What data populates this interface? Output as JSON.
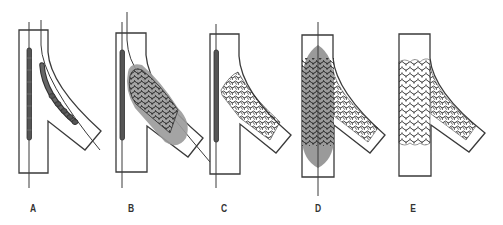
{
  "figure": {
    "colors": {
      "outline": "#3a3a3a",
      "balloon": "#9a9a9a",
      "stent_dark": "#2e2e2e",
      "background": "#ffffff"
    },
    "panels": [
      {
        "label": "A",
        "step": "Two guidewires with undeployed stent/balloon systems positioned in main vessel and side branch"
      },
      {
        "label": "B",
        "step": "Side branch stent deployed with inflated balloon, main vessel stent still undeployed"
      },
      {
        "label": "C",
        "step": "Side branch stent expanded, balloon removed; main vessel stent positioned"
      },
      {
        "label": "D",
        "step": "Main vessel stent deployed with inflated balloon"
      },
      {
        "label": "E",
        "step": "Final result: both stents expanded, wires and balloons removed"
      }
    ]
  }
}
